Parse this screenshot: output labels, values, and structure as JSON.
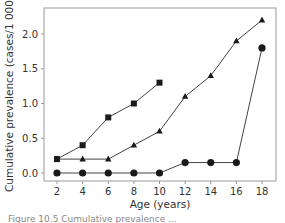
{
  "chart_data": {
    "type": "line",
    "title": "",
    "xlabel": "Age (years)",
    "ylabel": "Cumulative prevalence (cases/1 000)",
    "x": [
      2,
      4,
      6,
      8,
      10,
      12,
      14,
      16,
      18
    ],
    "xticks": [
      "2",
      "4",
      "6",
      "8",
      "10",
      "12",
      "14",
      "16",
      "18"
    ],
    "yticks": [
      "0.0",
      "0.5",
      "1.0",
      "1.5",
      "2.0"
    ],
    "xlim": [
      1,
      19
    ],
    "ylim": [
      -0.1,
      2.3
    ],
    "grid": false,
    "legend": null,
    "series": [
      {
        "name": "square-marker series",
        "marker": "square",
        "x": [
          2,
          4,
          6,
          8,
          10
        ],
        "values": [
          0.2,
          0.4,
          0.8,
          1.0,
          1.3
        ]
      },
      {
        "name": "triangle-marker series",
        "marker": "triangle",
        "x": [
          2,
          4,
          6,
          8,
          10,
          12,
          14,
          16,
          18
        ],
        "values": [
          0.2,
          0.2,
          0.2,
          0.4,
          0.6,
          1.1,
          1.4,
          1.9,
          2.2
        ]
      },
      {
        "name": "circle-marker series",
        "marker": "circle",
        "x": [
          2,
          4,
          6,
          8,
          10,
          12,
          14,
          16,
          18
        ],
        "values": [
          0.0,
          0.0,
          0.0,
          0.0,
          0.0,
          0.15,
          0.15,
          0.15,
          1.8
        ]
      }
    ]
  },
  "caption": "Figure 10.5  Cumulative prevalence ..."
}
